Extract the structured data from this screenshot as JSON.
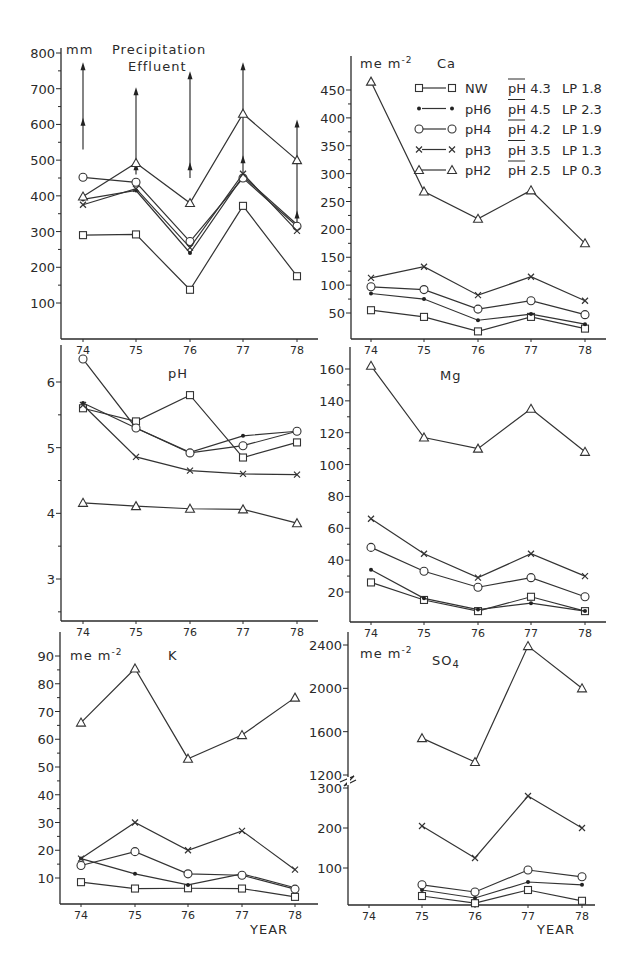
{
  "chart_data": [
    {
      "id": "precip",
      "type": "line",
      "title": "Precipitation Effluent",
      "unit_label": "mm",
      "xlabel": "",
      "ylabel": "mm",
      "categories": [
        "74",
        "75",
        "76",
        "77",
        "78"
      ],
      "ylim": [
        0,
        800
      ],
      "yticks": [
        100,
        200,
        300,
        400,
        500,
        600,
        700,
        800
      ],
      "precipitation_arrows": [
        {
          "x": "74",
          "from": 530,
          "to": 760,
          "mid_arrow": 605
        },
        {
          "x": "75",
          "from": 460,
          "to": 690,
          "mid_arrow": 480
        },
        {
          "x": "76",
          "from": 450,
          "to": 735,
          "mid_arrow": 480
        },
        {
          "x": "77",
          "from": 450,
          "to": 760,
          "mid_arrow": 500
        },
        {
          "x": "78",
          "from": 320,
          "to": 600,
          "mid_arrow": 345
        }
      ],
      "series": [
        {
          "name": "NW",
          "marker": "square",
          "values": [
            290,
            292,
            137,
            372,
            175
          ]
        },
        {
          "name": "pH6",
          "marker": "dot",
          "values": [
            390,
            415,
            240,
            455,
            320
          ]
        },
        {
          "name": "pH4",
          "marker": "circle",
          "values": [
            452,
            438,
            272,
            450,
            315
          ]
        },
        {
          "name": "pH3",
          "marker": "cross",
          "values": [
            375,
            420,
            255,
            462,
            302
          ]
        },
        {
          "name": "pH2",
          "marker": "triangle",
          "values": [
            398,
            492,
            380,
            630,
            500
          ]
        }
      ]
    },
    {
      "id": "ca",
      "type": "line",
      "title": "Ca",
      "unit_label": "me m-2",
      "categories": [
        "74",
        "75",
        "76",
        "77",
        "78"
      ],
      "ylim": [
        0,
        480
      ],
      "yticks": [
        50,
        100,
        150,
        200,
        250,
        300,
        350,
        400,
        450
      ],
      "series": [
        {
          "name": "NW",
          "marker": "square",
          "values": [
            55,
            43,
            17,
            43,
            22
          ]
        },
        {
          "name": "pH6",
          "marker": "dot",
          "values": [
            85,
            75,
            37,
            48,
            30
          ]
        },
        {
          "name": "pH4",
          "marker": "circle",
          "values": [
            97,
            92,
            57,
            72,
            47
          ]
        },
        {
          "name": "pH3",
          "marker": "cross",
          "values": [
            113,
            133,
            82,
            115,
            72
          ]
        },
        {
          "name": "pH2",
          "marker": "triangle",
          "values": [
            465,
            268,
            219,
            270,
            175
          ]
        }
      ]
    },
    {
      "id": "ph",
      "type": "line",
      "title": "pH",
      "unit_label": "",
      "categories": [
        "74",
        "75",
        "76",
        "77",
        "78"
      ],
      "ylim": [
        2.4,
        6.3
      ],
      "yticks": [
        3,
        4,
        5,
        6
      ],
      "series": [
        {
          "name": "NW",
          "marker": "square",
          "values": [
            5.6,
            5.4,
            5.8,
            4.85,
            5.08
          ]
        },
        {
          "name": "pH6",
          "marker": "dot",
          "values": [
            5.68,
            5.3,
            4.93,
            5.18,
            5.25
          ]
        },
        {
          "name": "pH4",
          "marker": "circle",
          "values": [
            6.35,
            5.3,
            4.92,
            5.03,
            5.25
          ]
        },
        {
          "name": "pH3",
          "marker": "cross",
          "values": [
            5.65,
            4.86,
            4.65,
            4.6,
            4.59
          ]
        },
        {
          "name": "pH2",
          "marker": "triangle",
          "values": [
            4.16,
            4.11,
            4.07,
            4.06,
            3.85
          ]
        }
      ]
    },
    {
      "id": "mg",
      "type": "line",
      "title": "Mg",
      "unit_label": "",
      "categories": [
        "74",
        "75",
        "76",
        "77",
        "78"
      ],
      "ylim": [
        0,
        170
      ],
      "yticks": [
        20,
        40,
        60,
        80,
        100,
        120,
        140,
        160
      ],
      "series": [
        {
          "name": "NW",
          "marker": "square",
          "values": [
            26,
            15,
            8,
            17,
            8
          ]
        },
        {
          "name": "pH6",
          "marker": "dot",
          "values": [
            34,
            16,
            9,
            13,
            8
          ]
        },
        {
          "name": "pH4",
          "marker": "circle",
          "values": [
            48,
            33,
            23,
            29,
            17
          ]
        },
        {
          "name": "pH3",
          "marker": "cross",
          "values": [
            66,
            44,
            29,
            44,
            30
          ]
        },
        {
          "name": "pH2",
          "marker": "triangle",
          "values": [
            162,
            117,
            110,
            135,
            108
          ]
        }
      ]
    },
    {
      "id": "k",
      "type": "line",
      "title": "K",
      "unit_label": "me m-2",
      "xlabel": "YEAR",
      "categories": [
        "74",
        "75",
        "76",
        "77",
        "78"
      ],
      "ylim": [
        0,
        98
      ],
      "yticks": [
        10,
        20,
        30,
        40,
        50,
        60,
        70,
        80,
        90
      ],
      "series": [
        {
          "name": "NW",
          "marker": "square",
          "values": [
            8.5,
            6.2,
            6.3,
            6.2,
            3.2
          ]
        },
        {
          "name": "pH6",
          "marker": "dot",
          "values": [
            17,
            11.5,
            7.5,
            11.5,
            6.5
          ]
        },
        {
          "name": "pH4",
          "marker": "circle",
          "values": [
            14.5,
            19.5,
            11.5,
            11,
            6
          ]
        },
        {
          "name": "pH3",
          "marker": "cross",
          "values": [
            17,
            30,
            20,
            27,
            13
          ]
        },
        {
          "name": "pH2",
          "marker": "triangle",
          "values": [
            66,
            85.5,
            53,
            61.5,
            75
          ]
        }
      ]
    },
    {
      "id": "so4",
      "type": "line",
      "title": "SO4",
      "unit_label": "me m-2",
      "xlabel": "YEAR",
      "categories": [
        "74",
        "75",
        "76",
        "77",
        "78"
      ],
      "axis_break": {
        "lower_max": 300,
        "upper_min": 1200
      },
      "yticks_lower": [
        100,
        200,
        300
      ],
      "yticks_upper": [
        1200,
        1600,
        2000,
        2400
      ],
      "series": [
        {
          "name": "NW",
          "marker": "square",
          "values": [
            null,
            30,
            12,
            45,
            18
          ]
        },
        {
          "name": "pH6",
          "marker": "dot",
          "values": [
            null,
            45,
            25,
            65,
            58
          ]
        },
        {
          "name": "pH4",
          "marker": "circle",
          "values": [
            null,
            58,
            40,
            95,
            78
          ]
        },
        {
          "name": "pH3",
          "marker": "cross",
          "values": [
            null,
            205,
            125,
            280,
            200
          ]
        },
        {
          "name": "pH2",
          "marker": "triangle",
          "values": [
            null,
            1540,
            1320,
            2390,
            2000
          ]
        }
      ]
    }
  ],
  "legend": [
    {
      "marker": "square",
      "name": "NW",
      "phbar": "pH 4.3",
      "lp": "LP 1.8"
    },
    {
      "marker": "dot",
      "name": "pH6",
      "phbar": "pH 4.5",
      "lp": "LP 2.3"
    },
    {
      "marker": "circle",
      "name": "pH4",
      "phbar": "pH 4.2",
      "lp": "LP 1.9"
    },
    {
      "marker": "cross",
      "name": "pH3",
      "phbar": "pH 3.5",
      "lp": "LP 1.3"
    },
    {
      "marker": "triangle",
      "name": "pH2",
      "phbar": "pH 2.5",
      "lp": "LP 0.3"
    }
  ],
  "labels": {
    "precip_unit": "mm",
    "precip_title_1": "Precipitation",
    "precip_title_2": "Effluent",
    "ca_unit": "me m",
    "ca_unit_exp": "-2",
    "ca_title": "Ca",
    "ph_title": "pH",
    "mg_title": "Mg",
    "k_unit": "me m",
    "k_unit_exp": "-2",
    "k_title": "K",
    "so4_unit": "me m",
    "so4_unit_exp": "-2",
    "so4_title": "SO",
    "so4_sub": "4",
    "year_label": "YEAR"
  }
}
